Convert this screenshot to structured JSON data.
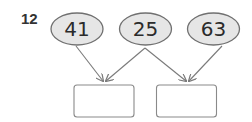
{
  "problem": {
    "number": "12",
    "inputs": [
      {
        "label": "41"
      },
      {
        "label": "25"
      },
      {
        "label": "63"
      }
    ],
    "answer_boxes": [
      {
        "value": ""
      },
      {
        "value": ""
      }
    ],
    "connections": [
      {
        "from": 0,
        "to": 0
      },
      {
        "from": 1,
        "to": 0
      },
      {
        "from": 1,
        "to": 1
      },
      {
        "from": 2,
        "to": 1
      }
    ]
  },
  "colors": {
    "ellipse_fill": "#e6e6e6",
    "ellipse_stroke": "#707070",
    "arrow": "#7a7a7a",
    "box_stroke": "#8a8a8a"
  }
}
